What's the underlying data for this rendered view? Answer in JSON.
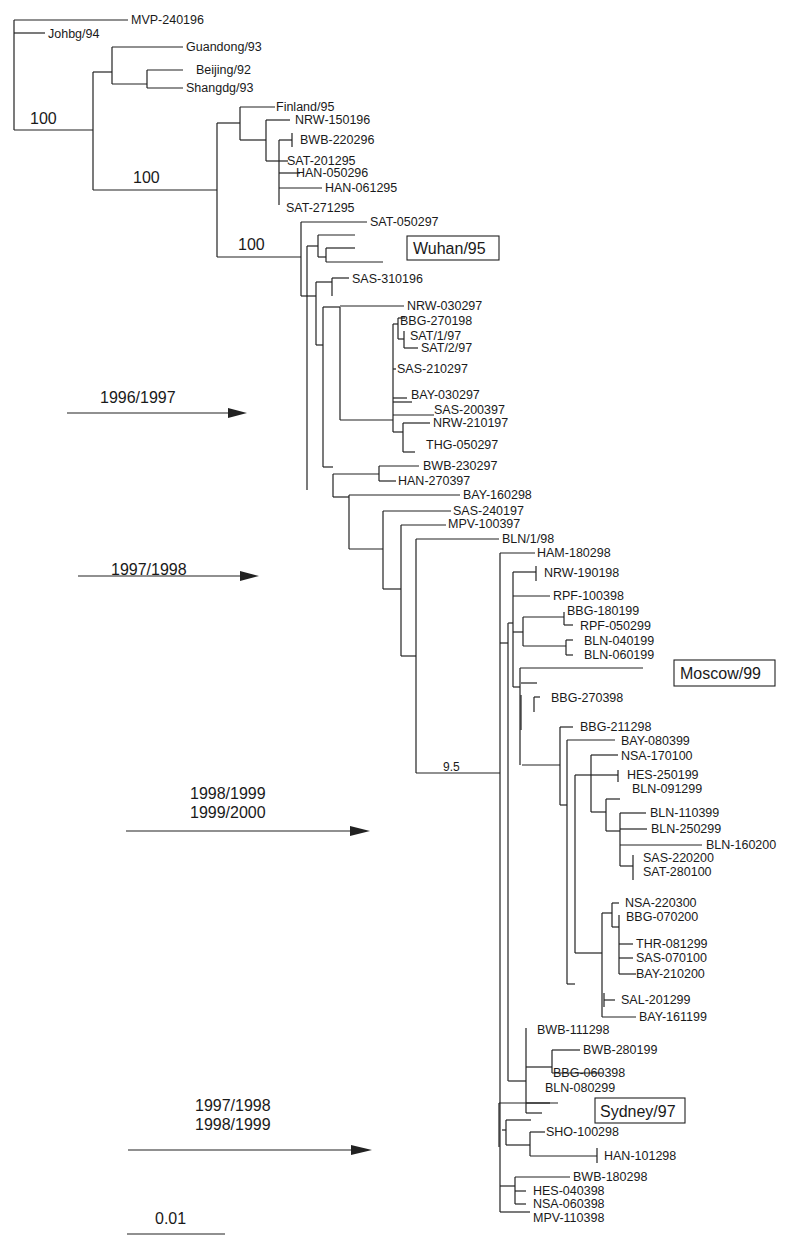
{
  "figure": {
    "type": "phylogenetic-tree",
    "scale_bar": {
      "label": "0.01"
    },
    "bootstrap_values": [
      "100",
      "100",
      "100",
      "9.5"
    ],
    "reference_strains": [
      "Wuhan/95",
      "Moscow/99",
      "Sydney/97"
    ],
    "season_arrows": [
      {
        "lines": [
          "1996/1997"
        ]
      },
      {
        "lines": [
          "1997/1998"
        ]
      },
      {
        "lines": [
          "1998/1999",
          "1999/2000"
        ]
      },
      {
        "lines": [
          "1997/1998",
          "1998/1999"
        ]
      }
    ],
    "leaves": [
      "MVP-240196",
      "Johbg/94",
      "Guandong/93",
      "Beijing/92",
      "Shangdg/93",
      "Finland/95",
      "NRW-150196",
      "BWB-220296",
      "SAT-201295",
      "HAN-050296",
      "HAN-061295",
      "SAT-271295",
      "SAT-050297",
      "SAS-310196",
      "NRW-030297",
      "BBG-270198",
      "SAT/1/97",
      "SAT/2/97",
      "SAS-210297",
      "BAY-030297",
      "SAS-200397",
      "NRW-210197",
      "THG-050297",
      "BWB-230297",
      "HAN-270397",
      "BAY-160298",
      "SAS-240197",
      "MPV-100397",
      "BLN/1/98",
      "HAM-180298",
      "NRW-190198",
      "RPF-100398",
      "BBG-180199",
      "RPF-050299",
      "BLN-040199",
      "BLN-060199",
      "BBG-270398",
      "BBG-211298",
      "BAY-080399",
      "NSA-170100",
      "HES-250199",
      "BLN-091299",
      "BLN-110399",
      "BLN-250299",
      "BLN-160200",
      "SAS-220200",
      "SAT-280100",
      "NSA-220300",
      "BBG-070200",
      "THR-081299",
      "SAS-070100",
      "BAY-210200",
      "SAL-201299",
      "BAY-161199",
      "BWB-111298",
      "BWB-280199",
      "BBG-060398",
      "BLN-080299",
      "SHO-100298",
      "HAN-101298",
      "BWB-180298",
      "HES-040398",
      "NSA-060398",
      "MPV-110398"
    ]
  }
}
